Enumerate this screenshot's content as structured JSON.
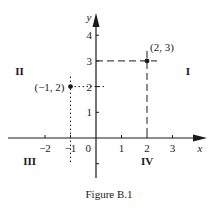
{
  "chart_data": {
    "type": "scatter",
    "title": "Figure B.1",
    "xlabel": "x",
    "ylabel": "y",
    "xlim": [
      -3.5,
      4.2
    ],
    "ylim": [
      -1.5,
      4.8
    ],
    "grid": false,
    "x_ticks": [
      {
        "value": -2,
        "label": "−2"
      },
      {
        "value": -1,
        "label": "−1"
      },
      {
        "value": 1,
        "label": "1"
      },
      {
        "value": 2,
        "label": "2"
      },
      {
        "value": 3,
        "label": "3"
      }
    ],
    "y_ticks": [
      {
        "value": 1,
        "label": "1"
      },
      {
        "value": 2,
        "label": "2"
      },
      {
        "value": 3,
        "label": "3"
      },
      {
        "value": 4,
        "label": "4"
      },
      {
        "value": -1,
        "label": ""
      }
    ],
    "origin_label": "0",
    "points": [
      {
        "x": 2,
        "y": 3,
        "label": "(2, 3)",
        "guide_style": "dashed"
      },
      {
        "x": -1,
        "y": 2,
        "label": "(−1, 2)",
        "guide_style": "dotted"
      }
    ],
    "quadrants": [
      {
        "label": "I",
        "x": 3.6,
        "y": 2.6
      },
      {
        "label": "II",
        "x": -3.0,
        "y": 2.6
      },
      {
        "label": "III",
        "x": -2.6,
        "y": -0.9
      },
      {
        "label": "IV",
        "x": 2.0,
        "y": -0.9
      }
    ]
  }
}
